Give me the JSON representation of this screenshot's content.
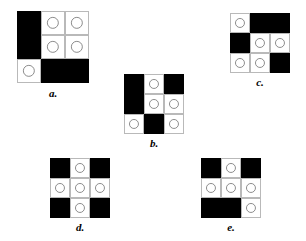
{
  "page": {
    "type": "visual-pattern-multiple-choice",
    "background_color": "#ffffff",
    "cell_black_color": "#000000",
    "cell_white_color": "#ffffff",
    "cell_border_color": "#b9b9b9",
    "ring_color": "#8d8d8d",
    "label_color": "#000000"
  },
  "figures": [
    {
      "id": "a",
      "label": "a.",
      "rows": 3,
      "cols": 3,
      "cells": [
        [
          "black",
          "circle",
          "circle"
        ],
        [
          "black",
          "circle",
          "circle"
        ],
        [
          "circle",
          "black",
          "black"
        ]
      ]
    },
    {
      "id": "b",
      "label": "b.",
      "rows": 3,
      "cols": 3,
      "cells": [
        [
          "black",
          "circle",
          "black"
        ],
        [
          "black",
          "circle",
          "circle"
        ],
        [
          "circle",
          "black",
          "circle"
        ]
      ]
    },
    {
      "id": "c",
      "label": "c.",
      "rows": 3,
      "cols": 3,
      "cells": [
        [
          "circle",
          "black",
          "black"
        ],
        [
          "black",
          "circle",
          "circle"
        ],
        [
          "circle",
          "circle",
          "black"
        ]
      ]
    },
    {
      "id": "d",
      "label": "d.",
      "rows": 3,
      "cols": 3,
      "cells": [
        [
          "black",
          "circle",
          "black"
        ],
        [
          "circle",
          "circle",
          "circle"
        ],
        [
          "black",
          "circle",
          "black"
        ]
      ]
    },
    {
      "id": "e",
      "label": "e.",
      "rows": 3,
      "cols": 3,
      "cells": [
        [
          "black",
          "circle",
          "black"
        ],
        [
          "circle",
          "circle",
          "circle"
        ],
        [
          "black",
          "black",
          "circle"
        ]
      ]
    }
  ]
}
